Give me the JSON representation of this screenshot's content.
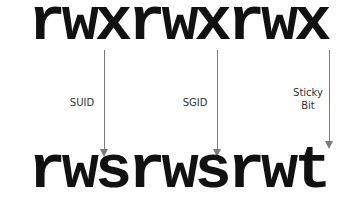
{
  "diagram": {
    "before": "rwxrwxrwx",
    "after": "rwsrwsrwt",
    "arrows": [
      {
        "label": "SUID",
        "from": "x",
        "to": "s"
      },
      {
        "label": "SGID",
        "from": "x",
        "to": "s"
      },
      {
        "label_line1": "Sticky",
        "label_line2": "Bit",
        "from": "x",
        "to": "t"
      }
    ],
    "colors": {
      "text": "#111111",
      "arrow": "#7a7a7a",
      "label": "#333333"
    }
  }
}
